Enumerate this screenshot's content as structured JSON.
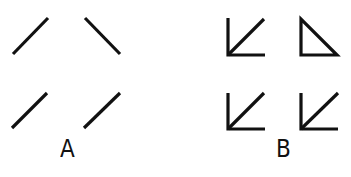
{
  "figure": {
    "stroke_color": "#111111",
    "background": "#ffffff",
    "panels": [
      {
        "label": "A",
        "description": "Four isolated diagonal line segments",
        "items": [
          {
            "position": "top-left",
            "shape": "line",
            "orientation": "ascending"
          },
          {
            "position": "top-right",
            "shape": "line",
            "orientation": "descending"
          },
          {
            "position": "bottom-left",
            "shape": "line",
            "orientation": "ascending"
          },
          {
            "position": "bottom-right",
            "shape": "line",
            "orientation": "ascending"
          }
        ]
      },
      {
        "label": "B",
        "description": "Same diagonals with added vertical and horizontal context lines",
        "items": [
          {
            "position": "top-left",
            "shape": "arrow-corner",
            "orientation": "ascending"
          },
          {
            "position": "top-right",
            "shape": "right-triangle",
            "orientation": "descending"
          },
          {
            "position": "bottom-left",
            "shape": "arrow-corner",
            "orientation": "ascending"
          },
          {
            "position": "bottom-right",
            "shape": "arrow-corner",
            "orientation": "ascending"
          }
        ]
      }
    ]
  }
}
